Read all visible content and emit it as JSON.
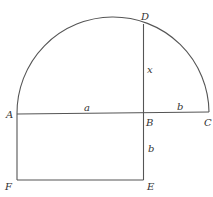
{
  "diagram": {
    "points": {
      "A": {
        "label": "A"
      },
      "B": {
        "label": "B"
      },
      "C": {
        "label": "C"
      },
      "D": {
        "label": "D"
      },
      "E": {
        "label": "E"
      },
      "F": {
        "label": "F"
      }
    },
    "segments": {
      "AB": {
        "label": "a"
      },
      "BC": {
        "label": "b"
      },
      "BD": {
        "label": "x"
      },
      "BE": {
        "label": "b"
      }
    },
    "colors": {
      "stroke": "#555555",
      "text": "#333333",
      "background": "#ffffff"
    }
  }
}
